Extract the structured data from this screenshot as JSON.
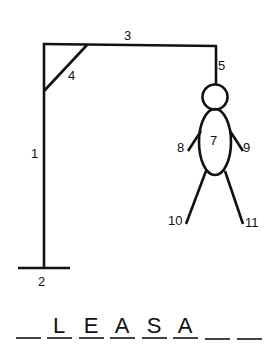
{
  "gallows": {
    "labels": {
      "pole": "1",
      "base": "2",
      "beam": "3",
      "brace": "4",
      "rope": "5",
      "body": "7",
      "left_arm": "8",
      "right_arm": "9",
      "left_leg": "10",
      "right_leg": "11"
    }
  },
  "word": {
    "slots": [
      "",
      "L",
      "E",
      "A",
      "S",
      "A",
      "",
      ""
    ]
  },
  "colors": {
    "ink": "#111111",
    "background": "#ffffff"
  }
}
